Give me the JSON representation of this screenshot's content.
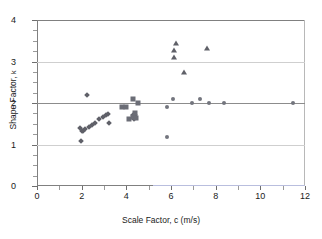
{
  "chart_data": {
    "type": "scatter",
    "title": "",
    "xlabel": "Scale Factor, c (m/s)",
    "ylabel": "Shape Factor, k",
    "xlim": [
      0,
      12
    ],
    "ylim": [
      0,
      4
    ],
    "xticks": [
      0,
      2,
      4,
      6,
      8,
      10,
      12
    ],
    "yticks": [
      0,
      1,
      2,
      3,
      4
    ],
    "xminor_ticks": [
      1,
      3,
      5,
      7,
      9,
      11
    ],
    "yminor_ticks": [
      0.25,
      0.5,
      0.75,
      1.25,
      1.5,
      1.75,
      2.25,
      2.5,
      2.75,
      3.25,
      3.5,
      3.75
    ],
    "grid": "horizontal",
    "gridlines_y": [
      1,
      2,
      3
    ],
    "legend": "none",
    "marker_color": "#5f6068",
    "grid_color": "#cfcfcf",
    "axis_color": "#808080",
    "baseline_accent_color": "#b9bede",
    "series": [
      {
        "name": "diamonds",
        "marker": "diamond",
        "points": [
          [
            1.95,
            1.09
          ],
          [
            1.93,
            1.4
          ],
          [
            2.0,
            1.33
          ],
          [
            2.06,
            1.33
          ],
          [
            2.17,
            1.37
          ],
          [
            2.25,
            2.2
          ],
          [
            2.32,
            1.41
          ],
          [
            2.45,
            1.48
          ],
          [
            2.6,
            1.52
          ],
          [
            2.78,
            1.62
          ],
          [
            2.96,
            1.67
          ],
          [
            3.08,
            1.71
          ],
          [
            3.17,
            1.73
          ],
          [
            3.22,
            1.52
          ],
          [
            4.3,
            1.7
          ],
          [
            4.35,
            1.72
          ],
          [
            4.4,
            1.7
          ],
          [
            4.35,
            1.62
          ]
        ]
      },
      {
        "name": "squares",
        "marker": "square",
        "points": [
          [
            3.82,
            1.9
          ],
          [
            3.97,
            1.9
          ],
          [
            4.1,
            1.62
          ],
          [
            4.28,
            2.1
          ],
          [
            4.3,
            1.66
          ],
          [
            4.44,
            1.63
          ],
          [
            4.52,
            2.0
          ],
          [
            4.4,
            1.75
          ]
        ]
      },
      {
        "name": "circles",
        "marker": "circle",
        "points": [
          [
            5.8,
            1.9
          ],
          [
            5.82,
            1.18
          ],
          [
            6.08,
            2.1
          ],
          [
            6.95,
            2.0
          ],
          [
            7.32,
            2.1
          ],
          [
            7.68,
            2.0
          ],
          [
            8.38,
            2.0
          ],
          [
            11.48,
            2.0
          ]
        ]
      },
      {
        "name": "triangles",
        "marker": "triangle",
        "points": [
          [
            6.12,
            3.12
          ],
          [
            6.15,
            3.28
          ],
          [
            6.22,
            3.44
          ],
          [
            6.6,
            2.75
          ],
          [
            7.62,
            3.33
          ]
        ]
      }
    ]
  },
  "axes": {
    "x_title": "Scale Factor, c (m/s)",
    "y_title_main": "Shape Factor, ",
    "y_title_sub": "k",
    "x_tick_labels": [
      "0",
      "2",
      "4",
      "6",
      "8",
      "10",
      "12"
    ],
    "y_tick_labels": [
      "0",
      "1",
      "2",
      "3",
      "4"
    ]
  }
}
